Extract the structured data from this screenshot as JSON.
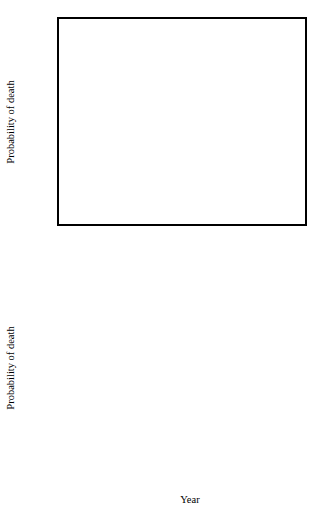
{
  "figure": {
    "panels": [
      {
        "id": "A",
        "letter": "A",
        "xlabel": "",
        "ylabel": "Probability of death"
      },
      {
        "id": "B",
        "letter": "B",
        "xlabel": "Year",
        "ylabel": "Probability of death"
      }
    ]
  },
  "chart_data": [
    {
      "type": "line",
      "panel": "A",
      "title": "",
      "xlabel": "",
      "ylabel": "Probability of death",
      "xlim": [
        1925,
        1991
      ],
      "ylim": [
        0,
        0.6
      ],
      "xticks": [
        1925,
        1935,
        1945,
        1955,
        1965,
        1975,
        1985
      ],
      "xtick_labels": [
        "1925",
        "1935",
        "1945",
        "1955",
        "1965",
        "1975",
        "1985"
      ],
      "yticks": [
        0,
        0.1,
        0.2,
        0.3,
        0.4,
        0.5,
        0.6
      ],
      "ytick_labels": [
        "0",
        "0.1",
        "0.2",
        "0.3",
        "0.4",
        "0.5",
        "0.6"
      ],
      "grid": false,
      "legend": "inline-annotations",
      "annotations": [
        {
          "text": "male",
          "x": 1937.5,
          "y": 0.122
        },
        {
          "text": "female",
          "x": 1947.5,
          "y": 0.032
        },
        {
          "text": "A",
          "x": 1930.5,
          "y": 0.555
        }
      ],
      "series": [
        {
          "name": "male",
          "style": "thick-solid",
          "segments": [
            {
              "x": [
                1930,
                1931,
                1932,
                1933,
                1934,
                1935,
                1936,
                1937,
                1938,
                1939,
                1940,
                1941,
                1942,
                1943,
                1944,
                1945,
                1946,
                1947,
                1948,
                1949,
                1950,
                1951,
                1952,
                1953,
                1954,
                1955,
                1956,
                1957,
                1958,
                1959,
                1960,
                1961,
                1962,
                1963,
                1964,
                1965,
                1966,
                1967,
                1968,
                1969
              ],
              "y": [
                0.046,
                0.056,
                0.066,
                0.074,
                0.078,
                0.08,
                0.082,
                0.088,
                0.09,
                0.09,
                0.09,
                0.09,
                0.091,
                0.092,
                0.094,
                0.099,
                0.106,
                0.114,
                0.122,
                0.128,
                0.132,
                0.134,
                0.131,
                0.126,
                0.12,
                0.112,
                0.1,
                0.086,
                0.074,
                0.066,
                0.063,
                0.066,
                0.076,
                0.09,
                0.104,
                0.117,
                0.128,
                0.138,
                0.15,
                0.161
              ]
            },
            {
              "x": [
                1971,
                1972,
                1973,
                1974,
                1975,
                1976,
                1977,
                1978,
                1979,
                1980,
                1981,
                1982,
                1983,
                1984,
                1985,
                1986,
                1987,
                1988,
                1989,
                1990
              ],
              "y": [
                0.46,
                0.432,
                0.425,
                0.402,
                0.392,
                0.42,
                0.374,
                0.34,
                0.3,
                0.258,
                0.216,
                0.186,
                0.17,
                0.158,
                0.15,
                0.152,
                0.166,
                0.172,
                0.178,
                0.166
              ]
            },
            {
              "x": [
                1985,
                1986,
                1987,
                1988,
                1989,
                1990
              ],
              "y": [
                0.15,
                0.152,
                0.166,
                0.172,
                0.178,
                0.166
              ]
            }
          ]
        },
        {
          "name": "female",
          "style": "thin-solid",
          "segments": [
            {
              "x": [
                1936,
                1937,
                1938,
                1939,
                1940,
                1941,
                1942,
                1943,
                1944,
                1945,
                1946,
                1947,
                1948,
                1949,
                1950,
                1951,
                1952,
                1953,
                1954,
                1955,
                1956,
                1957,
                1958,
                1959,
                1960,
                1961,
                1962,
                1963,
                1964,
                1965,
                1966,
                1967,
                1968,
                1969
              ],
              "y": [
                0.0,
                0.012,
                0.024,
                0.036,
                0.046,
                0.055,
                0.064,
                0.072,
                0.082,
                0.094,
                0.106,
                0.116,
                0.124,
                0.128,
                0.13,
                0.13,
                0.127,
                0.123,
                0.119,
                0.117,
                0.118,
                0.124,
                0.135,
                0.15,
                0.168,
                0.18,
                0.186,
                0.184,
                0.176,
                0.167,
                0.16,
                0.152,
                0.142,
                0.132
              ]
            },
            {
              "x": [
                1970,
                1971,
                1972,
                1973,
                1974,
                1975,
                1976,
                1977,
                1978,
                1979,
                1980,
                1981,
                1982,
                1983,
                1984,
                1985,
                1986,
                1987,
                1988,
                1989,
                1990
              ],
              "y": [
                0.552,
                0.51,
                0.472,
                0.444,
                0.416,
                0.392,
                0.362,
                0.324,
                0.282,
                0.242,
                0.206,
                0.178,
                0.16,
                0.147,
                0.136,
                0.122,
                0.104,
                0.092,
                0.098,
                0.086,
                0.072
              ]
            }
          ]
        }
      ]
    },
    {
      "type": "line",
      "panel": "B",
      "title": "",
      "xlabel": "Year",
      "ylabel": "Probability of death",
      "xlim": [
        1925,
        1991
      ],
      "ylim": [
        0,
        0.12
      ],
      "xticks": [
        1925,
        1935,
        1945,
        1955,
        1965,
        1975,
        1985
      ],
      "xtick_labels": [
        "1925",
        "1935",
        "1945",
        "1955",
        "1965",
        "1975",
        "1985"
      ],
      "yticks": [
        0,
        0.02,
        0.04,
        0.06,
        0.08,
        0.1,
        0.12
      ],
      "ytick_labels": [
        "0",
        "0.02",
        "0.04",
        "0.06",
        "0.08",
        "0.1",
        "0.12"
      ],
      "grid": false,
      "legend": "none",
      "annotations": [
        {
          "text": "B",
          "x": 1930.5,
          "y": 0.1125
        }
      ],
      "series": [
        {
          "name": "all",
          "style": "solid",
          "segments": [
            {
              "x": [
                1925,
                1926,
                1927,
                1928,
                1929,
                1930,
                1931,
                1932,
                1933,
                1934,
                1935,
                1936,
                1937,
                1938,
                1939,
                1940,
                1941,
                1942,
                1943,
                1944,
                1945,
                1946,
                1947,
                1948,
                1949,
                1950,
                1951,
                1952,
                1953,
                1954,
                1955,
                1956,
                1957,
                1958,
                1959,
                1960,
                1961,
                1962,
                1963,
                1964,
                1965,
                1966,
                1967,
                1968,
                1969
              ],
              "y": [
                0.0205,
                0.0235,
                0.0272,
                0.0278,
                0.0268,
                0.024,
                0.0182,
                0.0098,
                0.0128,
                0.0152,
                0.0158,
                0.0148,
                0.0132,
                0.0162,
                0.019,
                0.0196,
                0.0215,
                0.0236,
                0.027,
                0.0254,
                0.0262,
                0.0246,
                0.0244,
                0.0216,
                0.0226,
                0.0208,
                0.0232,
                0.0216,
                0.0186,
                0.0154,
                0.0148,
                0.0164,
                0.0158,
                0.0178,
                0.0192,
                0.0198,
                0.0216,
                0.0222,
                0.024,
                0.0244,
                0.0234,
                0.0216,
                0.0218,
                0.0216,
                0.0192
              ]
            },
            {
              "x": [
                1970,
                1971,
                1972,
                1973,
                1974,
                1975,
                1976,
                1977,
                1978,
                1979,
                1980,
                1981,
                1982,
                1983,
                1984,
                1985,
                1986,
                1987,
                1988,
                1989,
                1990
              ],
              "y": [
                0.1072,
                0.096,
                0.086,
                0.078,
                0.07,
                0.0625,
                0.059,
                0.023,
                0.0112,
                0.008,
                0.0058,
                0.004,
                0.003,
                0.0026,
                0.0026,
                0.0028,
                0.003,
                0.003,
                0.0032,
                0.0034,
                0.004
              ]
            }
          ]
        }
      ]
    }
  ]
}
